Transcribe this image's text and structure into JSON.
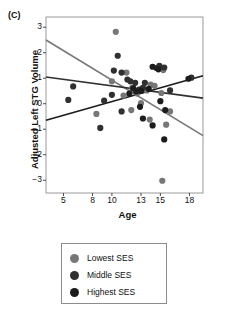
{
  "panel": {
    "label": "(C)"
  },
  "legend": {
    "position": "below-plot",
    "items": [
      {
        "label": "Lowest SES",
        "color": "#777777"
      },
      {
        "label": "Middle SES",
        "color": "#303030"
      },
      {
        "label": "Highest SES",
        "color": "#1c1c1c"
      }
    ]
  },
  "axes": {
    "x_label": "Age",
    "y_label": "Adjusted Left STG Volume",
    "x_ticks": [
      5,
      8,
      10,
      13,
      15,
      18
    ],
    "y_ticks": [
      3,
      2,
      1,
      0,
      -1,
      -2,
      -3
    ],
    "xlim": [
      3.2,
      19.4
    ],
    "ylim": [
      -3.5,
      3.4
    ],
    "grid": false,
    "frame": true
  },
  "chart_data": {
    "type": "scatter",
    "title": "",
    "subtitle": "",
    "xlabel": "Age",
    "ylabel": "Adjusted Left STG Volume",
    "xlim": [
      3.2,
      19.4
    ],
    "ylim": [
      -3.5,
      3.4
    ],
    "xticks": [
      5,
      8,
      10,
      13,
      15,
      18
    ],
    "yticks": [
      3,
      2,
      1,
      0,
      -1,
      -2,
      -3
    ],
    "grid": false,
    "legend_position": "below",
    "series": [
      {
        "name": "Lowest SES",
        "color": "#777777",
        "points": [
          [
            10.4,
            2.82
          ],
          [
            10.0,
            0.88
          ],
          [
            11.5,
            1.22
          ],
          [
            12.1,
            0.62
          ],
          [
            12.6,
            0.4
          ],
          [
            13.1,
            0.58
          ],
          [
            13.6,
            0.52
          ],
          [
            14.0,
            0.75
          ],
          [
            14.4,
            0.7
          ],
          [
            15.1,
            0.42
          ],
          [
            15.3,
            1.32
          ],
          [
            15.6,
            -0.82
          ],
          [
            16.0,
            -0.3
          ],
          [
            13.9,
            -0.62
          ],
          [
            13.0,
            0.02
          ],
          [
            12.0,
            -0.25
          ],
          [
            11.2,
            0.32
          ],
          [
            8.4,
            -0.4
          ],
          [
            15.2,
            -3.02
          ]
        ]
      },
      {
        "name": "Middle SES",
        "color": "#303030",
        "points": [
          [
            10.6,
            1.88
          ],
          [
            10.2,
            1.3
          ],
          [
            11.0,
            1.22
          ],
          [
            11.6,
            0.95
          ],
          [
            11.9,
            0.88
          ],
          [
            12.4,
            0.82
          ],
          [
            13.4,
            0.82
          ],
          [
            14.6,
            1.4
          ],
          [
            14.9,
            1.48
          ],
          [
            15.4,
            1.42
          ],
          [
            16.0,
            0.52
          ],
          [
            18.2,
            1.02
          ],
          [
            13.2,
            0.62
          ],
          [
            12.8,
            0.55
          ],
          [
            10.0,
            0.35
          ],
          [
            9.2,
            0.12
          ],
          [
            5.5,
            0.15
          ],
          [
            6.0,
            0.68
          ],
          [
            8.8,
            -0.95
          ],
          [
            11.0,
            -0.3
          ]
        ]
      },
      {
        "name": "Highest SES",
        "color": "#1c1c1c",
        "points": [
          [
            14.2,
            1.45
          ],
          [
            14.8,
            1.35
          ],
          [
            13.8,
            0.58
          ],
          [
            13.0,
            0.5
          ],
          [
            12.5,
            0.48
          ],
          [
            12.2,
            0.6
          ],
          [
            11.8,
            0.4
          ],
          [
            15.0,
            0.1
          ],
          [
            15.5,
            -0.25
          ],
          [
            14.2,
            -0.85
          ],
          [
            13.2,
            -0.58
          ],
          [
            15.4,
            -1.4
          ],
          [
            17.9,
            0.98
          ],
          [
            12.9,
            -0.12
          ]
        ]
      }
    ],
    "trend_lines": [
      {
        "name": "Lowest SES",
        "color": "#777777",
        "x0": 3.2,
        "y0": 2.5,
        "x1": 19.4,
        "y1": -1.25,
        "slope": -0.231
      },
      {
        "name": "Middle SES",
        "color": "#303030",
        "x0": 3.2,
        "y0": 1.05,
        "x1": 19.4,
        "y1": 0.22,
        "slope": -0.051
      },
      {
        "name": "Highest SES",
        "color": "#1c1c1c",
        "x0": 3.2,
        "y0": -0.65,
        "x1": 19.4,
        "y1": 1.1,
        "slope": 0.108
      }
    ],
    "annotations": [
      {
        "text": "(C)",
        "role": "panel-label"
      }
    ]
  }
}
